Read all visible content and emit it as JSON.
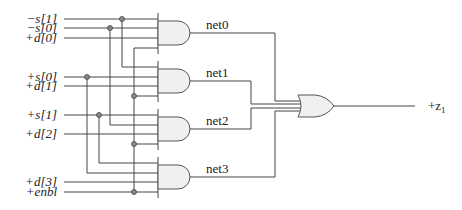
{
  "diagram": {
    "title": "",
    "type": "logic-circuit",
    "inputs": [
      {
        "label": "−s[1]",
        "y": 19
      },
      {
        "label": "−s[0]",
        "y": 28
      },
      {
        "label": "+d[0]",
        "y": 38
      },
      {
        "label": "+s[0]",
        "y": 77
      },
      {
        "label": "+d[1]",
        "y": 86
      },
      {
        "label": "+s[1]",
        "y": 115
      },
      {
        "label": "+d[2]",
        "y": 134
      },
      {
        "label": "+d[3]",
        "y": 182
      },
      {
        "label": "+enbl",
        "y": 192
      }
    ],
    "and_gates": [
      {
        "id": "and0",
        "output_net": "net0"
      },
      {
        "id": "and1",
        "output_net": "net1"
      },
      {
        "id": "and2",
        "output_net": "net2"
      },
      {
        "id": "and3",
        "output_net": "net3"
      }
    ],
    "or_gate": {
      "id": "or0",
      "inputs": [
        "net0",
        "net1",
        "net2",
        "net3"
      ]
    },
    "output": {
      "label": "+z",
      "subscript": "1"
    },
    "colors": {
      "wire": "#444444",
      "gate_fill": "#f0f0f0",
      "junction": "#888888"
    }
  }
}
